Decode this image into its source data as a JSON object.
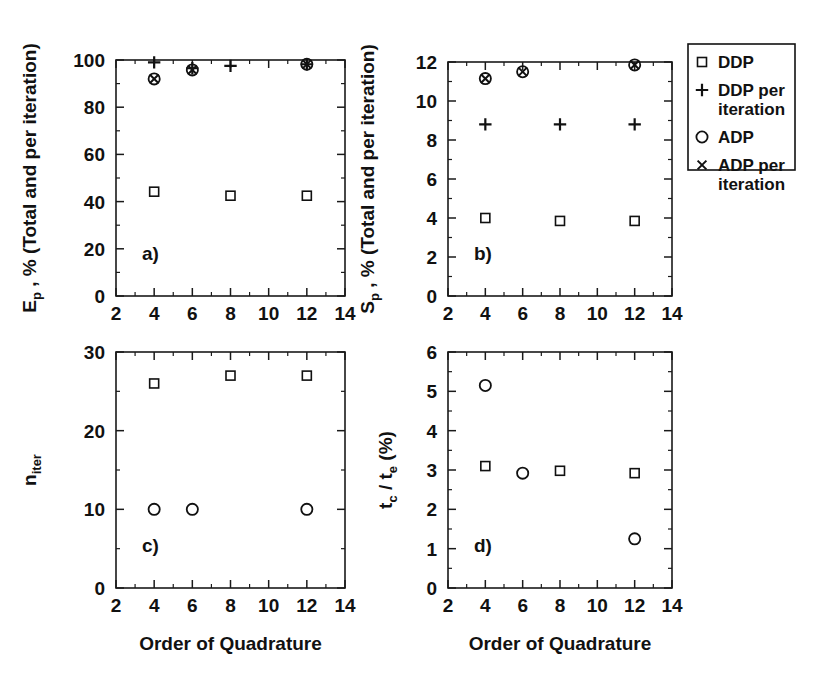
{
  "figure": {
    "legend": {
      "entries": [
        {
          "marker": "square",
          "label": "DDP"
        },
        {
          "marker": "plus",
          "label": "DDP per",
          "label2": "iteration"
        },
        {
          "marker": "circle",
          "label": "ADP"
        },
        {
          "marker": "cross",
          "label": "ADP per",
          "label2": "iteration"
        }
      ]
    },
    "panels": [
      {
        "id": "a",
        "letter": "a)",
        "ylabel_main": "E",
        "ylabel_sub": "p",
        "ylabel_rest": " , % (Total and per iteration)",
        "xlabel": ""
      },
      {
        "id": "b",
        "letter": "b)",
        "ylabel_main": "S",
        "ylabel_sub": "p",
        "ylabel_rest": " , % (Total and per iteration)",
        "xlabel": ""
      },
      {
        "id": "c",
        "letter": "c)",
        "ylabel_main": "n",
        "ylabel_sub": "iter",
        "ylabel_rest": "",
        "xlabel": "Order of Quadrature"
      },
      {
        "id": "d",
        "letter": "d)",
        "ylabel_main": "t",
        "ylabel_sub": "c",
        "ylabel_rest": "",
        "ylabel_main2": " / t",
        "ylabel_sub2": "e",
        "ylabel_rest2": " (%)",
        "xlabel": "Order of Quadrature"
      }
    ]
  },
  "chart_data": [
    {
      "type": "scatter",
      "panel": "a",
      "title": "",
      "xlabel": "Order of Quadrature",
      "ylabel": "E_p , % (Total and per iteration)",
      "xlim": [
        2,
        14
      ],
      "ylim": [
        0,
        100
      ],
      "xticks": [
        2,
        4,
        6,
        8,
        10,
        12,
        14
      ],
      "yticks": [
        0,
        20,
        40,
        60,
        80,
        100
      ],
      "xtick_labels": [
        "2",
        "4",
        "6",
        "8",
        "10",
        "12",
        "14"
      ],
      "ytick_labels": [
        "0",
        "20",
        "40",
        "60",
        "80",
        "100"
      ],
      "grid": false,
      "series": [
        {
          "name": "DDP",
          "marker": "square",
          "x": [
            4,
            8,
            12
          ],
          "y": [
            44.2,
            42.5,
            42.5
          ]
        },
        {
          "name": "DDP per iteration",
          "marker": "plus",
          "x": [
            4,
            6,
            8,
            12
          ],
          "y": [
            99.0,
            96.5,
            97.5,
            98.2
          ]
        },
        {
          "name": "ADP",
          "marker": "circle",
          "x": [
            4,
            6,
            12
          ],
          "y": [
            92.0,
            95.8,
            98.2
          ]
        },
        {
          "name": "ADP per iteration",
          "marker": "cross",
          "x": [
            4,
            6,
            12
          ],
          "y": [
            92.0,
            95.8,
            98.2
          ]
        }
      ]
    },
    {
      "type": "scatter",
      "panel": "b",
      "title": "",
      "xlabel": "Order of Quadrature",
      "ylabel": "S_p , % (Total and per iteration)",
      "xlim": [
        2,
        14
      ],
      "ylim": [
        0,
        12
      ],
      "xticks": [
        2,
        4,
        6,
        8,
        10,
        12,
        14
      ],
      "yticks": [
        0,
        2,
        4,
        6,
        8,
        10,
        12
      ],
      "xtick_labels": [
        "2",
        "4",
        "6",
        "8",
        "10",
        "12",
        "14"
      ],
      "ytick_labels": [
        "0",
        "2",
        "4",
        "6",
        "8",
        "10",
        "12"
      ],
      "grid": false,
      "series": [
        {
          "name": "DDP",
          "marker": "square",
          "x": [
            4,
            8,
            12
          ],
          "y": [
            4.0,
            3.85,
            3.85
          ]
        },
        {
          "name": "DDP per iteration",
          "marker": "plus",
          "x": [
            4,
            8,
            12
          ],
          "y": [
            8.8,
            8.8,
            8.8
          ]
        },
        {
          "name": "ADP",
          "marker": "circle",
          "x": [
            4,
            6,
            12
          ],
          "y": [
            11.15,
            11.5,
            11.85
          ]
        },
        {
          "name": "ADP per iteration",
          "marker": "cross",
          "x": [
            4,
            6,
            12
          ],
          "y": [
            11.15,
            11.5,
            11.85
          ]
        }
      ]
    },
    {
      "type": "scatter",
      "panel": "c",
      "title": "",
      "xlabel": "Order of Quadrature",
      "ylabel": "n_iter",
      "xlim": [
        2,
        14
      ],
      "ylim": [
        0,
        30
      ],
      "xticks": [
        2,
        4,
        6,
        8,
        10,
        12,
        14
      ],
      "yticks": [
        0,
        10,
        20,
        30
      ],
      "xtick_labels": [
        "2",
        "4",
        "6",
        "8",
        "10",
        "12",
        "14"
      ],
      "ytick_labels": [
        "0",
        "10",
        "20",
        "30"
      ],
      "grid": false,
      "series": [
        {
          "name": "DDP",
          "marker": "square",
          "x": [
            4,
            8,
            12
          ],
          "y": [
            26.0,
            27.0,
            27.0
          ]
        },
        {
          "name": "ADP",
          "marker": "circle",
          "x": [
            4,
            6,
            12
          ],
          "y": [
            10.0,
            10.0,
            10.0
          ]
        }
      ]
    },
    {
      "type": "scatter",
      "panel": "d",
      "title": "",
      "xlabel": "Order of Quadrature",
      "ylabel": "t_c / t_e (%)",
      "xlim": [
        2,
        14
      ],
      "ylim": [
        0,
        6
      ],
      "xticks": [
        2,
        4,
        6,
        8,
        10,
        12,
        14
      ],
      "yticks": [
        0,
        1,
        2,
        3,
        4,
        5,
        6
      ],
      "xtick_labels": [
        "2",
        "4",
        "6",
        "8",
        "10",
        "12",
        "14"
      ],
      "ytick_labels": [
        "0",
        "1",
        "2",
        "3",
        "4",
        "5",
        "6"
      ],
      "grid": false,
      "series": [
        {
          "name": "DDP",
          "marker": "square",
          "x": [
            4,
            8,
            12
          ],
          "y": [
            3.1,
            2.98,
            2.92
          ]
        },
        {
          "name": "ADP",
          "marker": "circle",
          "x": [
            4,
            6,
            12
          ],
          "y": [
            5.15,
            2.92,
            1.25
          ]
        }
      ]
    }
  ]
}
